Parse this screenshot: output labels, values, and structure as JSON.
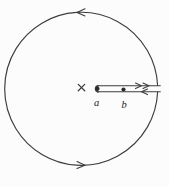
{
  "figure": {
    "type": "contour-diagram",
    "labels": {
      "point_a": "a",
      "point_b": "b"
    },
    "markers": {
      "pole_marker": "cross",
      "branch_points": [
        "a",
        "b"
      ]
    },
    "arrows": {
      "circle_top_direction": "left",
      "circle_bottom_direction": "right",
      "cut_upper_edge_direction": "right",
      "cut_lower_edge_direction": "left",
      "orientation": "counterclockwise"
    },
    "colors": {
      "line": "#3d3d3d",
      "dot": "#2b2b2b",
      "label": "#1a1a1a",
      "background": "#fcfcfc"
    }
  }
}
